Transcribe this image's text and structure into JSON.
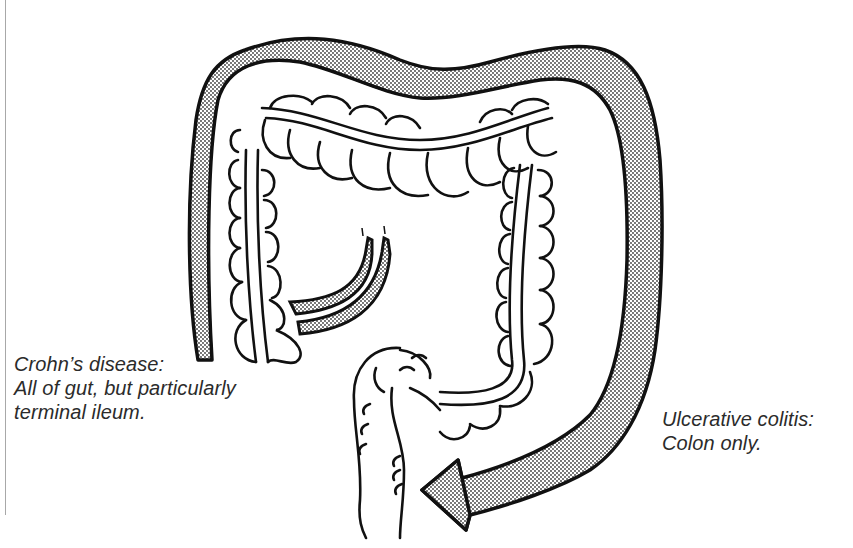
{
  "figure": {
    "colors": {
      "line": "#111111",
      "stipple_dot": "#3a3a3a",
      "background": "#ffffff",
      "text": "#2b2b2b",
      "page_rule": "#a8a8a8"
    }
  },
  "labels": {
    "crohns": {
      "line1": "Crohn’s disease:",
      "line2": "All of gut, but particularly",
      "line3": "terminal ileum."
    },
    "ulcerative_colitis": {
      "line1": "Ulcerative colitis:",
      "line2": "Colon only."
    }
  },
  "elements": {
    "colon": "colon-outline",
    "terminal_ileum": "terminal-ileum",
    "rectum": "rectum",
    "crohns_band": "crohns-shaded-band",
    "uc_arrow": "ulcerative-colitis-arrow"
  }
}
